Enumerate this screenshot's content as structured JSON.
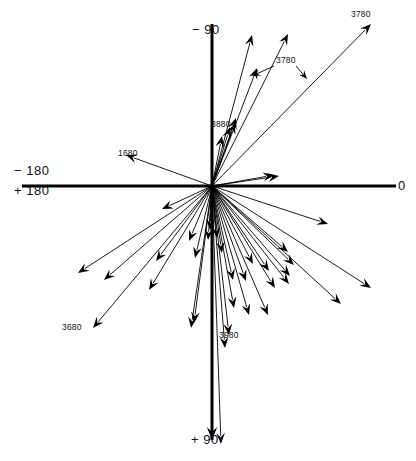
{
  "figure": {
    "background": "#ffffff",
    "ink": "#000000"
  },
  "axes": {
    "origin": {
      "x": 212,
      "y": 186
    },
    "lines": [
      {
        "name": "horizontal-axis",
        "x1": 22,
        "y1": 186,
        "x2": 396,
        "y2": 186,
        "width": 3
      },
      {
        "name": "vertical-axis",
        "x1": 212,
        "y1": 24,
        "x2": 212,
        "y2": 440,
        "width": 3
      }
    ],
    "vertical_arrowhead": {
      "x": 212,
      "y": 440,
      "angle": 90
    },
    "labels": [
      {
        "id": "minus-90",
        "text": "− 90",
        "x": 192,
        "y": 22,
        "anchor": "top-axis"
      },
      {
        "id": "zero",
        "text": "0",
        "x": 398,
        "y": 178,
        "anchor": "right-axis"
      },
      {
        "id": "minus-180",
        "text": "− 180",
        "x": 14,
        "y": 163,
        "anchor": "left-axis-upper"
      },
      {
        "id": "plus-180",
        "text": "+ 180",
        "x": 14,
        "y": 183,
        "anchor": "left-axis-lower"
      },
      {
        "id": "plus-90",
        "text": "+ 90",
        "x": 191,
        "y": 432,
        "anchor": "bottom-axis"
      }
    ]
  },
  "chart_data": {
    "type": "scatter",
    "title": "",
    "xlabel": "",
    "ylabel": "",
    "coordinate_system": "polar-angle-degrees",
    "angle_convention": "0 at right, -90 up, +90 down, +/-180 left",
    "note": "Each datum is a vector drawn from the common origin; angle is the bearing, length is the magnitude in pixels.",
    "vectors": [
      {
        "id": 1,
        "angle_deg": -75.0,
        "length": 156,
        "tip_x": 252,
        "tip_y": 35
      },
      {
        "id": 2,
        "angle_deg": -63.5,
        "length": 170,
        "tip_x": 288,
        "tip_y": 34
      },
      {
        "id": 3,
        "angle_deg": -45.5,
        "length": 227,
        "tip_x": 371,
        "tip_y": 24
      },
      {
        "id": 4,
        "angle_deg": -69.0,
        "length": 126,
        "tip_x": 257,
        "tip_y": 68
      },
      {
        "id": 5,
        "angle_deg": -71.0,
        "length": 72,
        "tip_x": 236,
        "tip_y": 118
      },
      {
        "id": 6,
        "angle_deg": -69.5,
        "length": 67,
        "tip_x": 235,
        "tip_y": 123
      },
      {
        "id": 7,
        "angle_deg": -73.5,
        "length": 62,
        "tip_x": 230,
        "tip_y": 127
      },
      {
        "id": 8,
        "angle_deg": -79.0,
        "length": 51,
        "tip_x": 222,
        "tip_y": 136
      },
      {
        "id": 9,
        "angle_deg": -10.5,
        "length": 63,
        "tip_x": 274,
        "tip_y": 175
      },
      {
        "id": 10,
        "angle_deg": -8.5,
        "length": 68,
        "tip_x": 279,
        "tip_y": 176
      },
      {
        "id": 11,
        "angle_deg": 160.0,
        "length": 92,
        "tip_x": 126,
        "tip_y": 155
      },
      {
        "id": 12,
        "angle_deg": 18.0,
        "length": 122,
        "tip_x": 328,
        "tip_y": 224
      },
      {
        "id": 13,
        "angle_deg": 25.0,
        "length": 175,
        "tip_x": 371,
        "tip_y": 288
      },
      {
        "id": 14,
        "angle_deg": 32.5,
        "length": 153,
        "tip_x": 341,
        "tip_y": 304
      },
      {
        "id": 15,
        "angle_deg": 41.0,
        "length": 100,
        "tip_x": 288,
        "tip_y": 252
      },
      {
        "id": 16,
        "angle_deg": 44.0,
        "length": 114,
        "tip_x": 294,
        "tip_y": 265
      },
      {
        "id": 17,
        "angle_deg": 49.0,
        "length": 119,
        "tip_x": 290,
        "tip_y": 276
      },
      {
        "id": 18,
        "angle_deg": 52.0,
        "length": 125,
        "tip_x": 289,
        "tip_y": 284
      },
      {
        "id": 19,
        "angle_deg": 56.0,
        "length": 102,
        "tip_x": 269,
        "tip_y": 271
      },
      {
        "id": 20,
        "angle_deg": 58.5,
        "length": 120,
        "tip_x": 275,
        "tip_y": 288
      },
      {
        "id": 21,
        "angle_deg": 62.0,
        "length": 88,
        "tip_x": 253,
        "tip_y": 264
      },
      {
        "id": 22,
        "angle_deg": 66.5,
        "length": 141,
        "tip_x": 268,
        "tip_y": 315
      },
      {
        "id": 23,
        "angle_deg": 70.5,
        "length": 101,
        "tip_x": 246,
        "tip_y": 281
      },
      {
        "id": 24,
        "angle_deg": 74.0,
        "length": 134,
        "tip_x": 249,
        "tip_y": 315
      },
      {
        "id": 25,
        "angle_deg": 77.5,
        "length": 96,
        "tip_x": 233,
        "tip_y": 280
      },
      {
        "id": 26,
        "angle_deg": 79.5,
        "length": 124,
        "tip_x": 234,
        "tip_y": 308
      },
      {
        "id": 27,
        "angle_deg": 81.5,
        "length": 68,
        "tip_x": 222,
        "tip_y": 253
      },
      {
        "id": 28,
        "angle_deg": 83.5,
        "length": 150,
        "tip_x": 229,
        "tip_y": 335
      },
      {
        "id": 29,
        "angle_deg": 85.0,
        "length": 52,
        "tip_x": 217,
        "tip_y": 238
      },
      {
        "id": 30,
        "angle_deg": 85.5,
        "length": 163,
        "tip_x": 225,
        "tip_y": 348
      },
      {
        "id": 31,
        "angle_deg": 88.0,
        "length": 258,
        "tip_x": 221,
        "tip_y": 444
      },
      {
        "id": 32,
        "angle_deg": 92.0,
        "length": 44,
        "tip_x": 210,
        "tip_y": 230
      },
      {
        "id": 33,
        "angle_deg": 94.5,
        "length": 54,
        "tip_x": 208,
        "tip_y": 240
      },
      {
        "id": 34,
        "angle_deg": 97.5,
        "length": 138,
        "tip_x": 194,
        "tip_y": 323
      },
      {
        "id": 35,
        "angle_deg": 98.5,
        "length": 144,
        "tip_x": 191,
        "tip_y": 328
      },
      {
        "id": 36,
        "angle_deg": 103.0,
        "length": 74,
        "tip_x": 195,
        "tip_y": 258
      },
      {
        "id": 37,
        "angle_deg": 113.0,
        "length": 60,
        "tip_x": 189,
        "tip_y": 241
      },
      {
        "id": 38,
        "angle_deg": 121.0,
        "length": 122,
        "tip_x": 149,
        "tip_y": 290
      },
      {
        "id": 39,
        "angle_deg": 126.5,
        "length": 94,
        "tip_x": 156,
        "tip_y": 261
      },
      {
        "id": 40,
        "angle_deg": 130.0,
        "length": 185,
        "tip_x": 93,
        "tip_y": 328
      },
      {
        "id": 41,
        "angle_deg": 139.0,
        "length": 144,
        "tip_x": 104,
        "tip_y": 280
      },
      {
        "id": 42,
        "angle_deg": 147.0,
        "length": 160,
        "tip_x": 78,
        "tip_y": 273
      },
      {
        "id": 43,
        "angle_deg": 155.0,
        "length": 55,
        "tip_x": 162,
        "tip_y": 209
      }
    ],
    "annotated_vectors": [
      {
        "label": "3780",
        "target_ids": [
          1,
          3
        ]
      },
      {
        "label": "3880",
        "target_ids": [
          8
        ]
      },
      {
        "label": "1680",
        "target_ids": [
          11
        ]
      },
      {
        "label": "3680",
        "target_ids": [
          40
        ]
      },
      {
        "label": "3980",
        "target_ids": [
          31
        ]
      }
    ]
  },
  "annotations": [
    {
      "id": "ann-3780",
      "text": "3780",
      "label_x": 276,
      "label_y": 55,
      "leaders": [
        {
          "x1": 274,
          "y1": 66,
          "x2": 252,
          "y2": 76
        },
        {
          "x1": 296,
          "y1": 66,
          "x2": 307,
          "y2": 79
        }
      ]
    },
    {
      "id": "ann-3780-top",
      "text": "3780",
      "label_x": 351,
      "label_y": 9,
      "leaders": []
    },
    {
      "id": "ann-3880",
      "text": "3880",
      "label_x": 211,
      "label_y": 119,
      "leaders": []
    },
    {
      "id": "ann-1680",
      "text": "1680",
      "label_x": 118,
      "label_y": 148,
      "leaders": []
    },
    {
      "id": "ann-3680",
      "text": "3680",
      "label_x": 62,
      "label_y": 322,
      "leaders": []
    },
    {
      "id": "ann-3980",
      "text": "3980",
      "label_x": 219,
      "label_y": 330,
      "leaders": []
    }
  ]
}
